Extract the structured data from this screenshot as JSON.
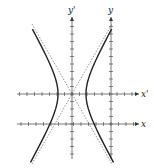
{
  "diagram": {
    "type": "hyperbola-with-rotated-translated-axes",
    "axes": [
      {
        "id": "x-prime",
        "label": "x'",
        "orientation": "horizontal",
        "y": 94,
        "from": 17,
        "to": 139
      },
      {
        "id": "x",
        "label": "x",
        "orientation": "horizontal",
        "y": 124,
        "from": 17,
        "to": 139
      },
      {
        "id": "y-prime",
        "label": "y'",
        "orientation": "vertical",
        "x": 72,
        "from": 159,
        "to": 17
      },
      {
        "id": "y",
        "label": "y",
        "orientation": "vertical",
        "x": 111,
        "from": 159,
        "to": 17
      }
    ],
    "tick_spacing": 7.5,
    "center": {
      "x": 72,
      "y": 94
    },
    "vertices": [
      {
        "x": 58,
        "y": 94
      },
      {
        "x": 86,
        "y": 94
      }
    ],
    "asymptotes": [
      {
        "from": {
          "x": 32,
          "y": 24
        },
        "to": {
          "x": 112,
          "y": 164
        },
        "style": "dotted"
      },
      {
        "from": {
          "x": 112,
          "y": 24
        },
        "to": {
          "x": 32,
          "y": 164
        },
        "style": "dotted"
      }
    ],
    "colors": {
      "curve": "#222222",
      "axis": "#555555",
      "asymptote": "#777777",
      "background": "#ffffff"
    }
  }
}
